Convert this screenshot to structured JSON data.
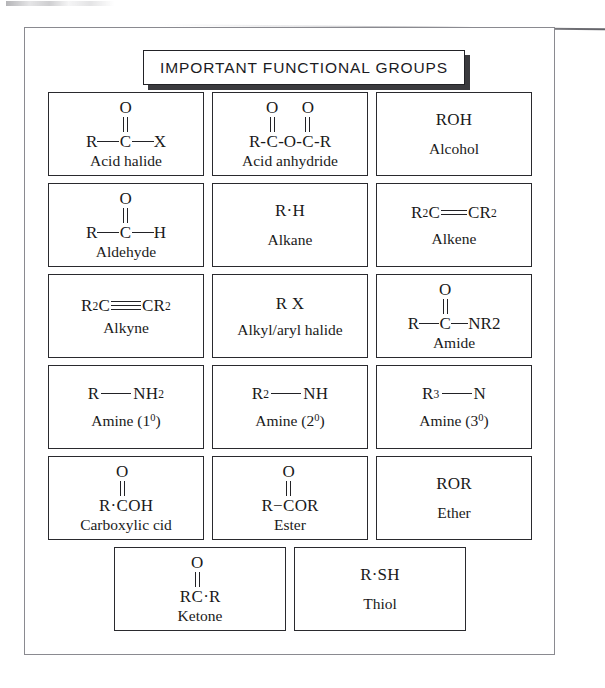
{
  "document": {
    "title": "IMPORTANT FUNCTIONAL GROUPS"
  },
  "groups": [
    {
      "name": "acid-halide",
      "label": "Acid halide",
      "formula": "R—C(=O)—X",
      "left": "R",
      "center": "C",
      "right": "X",
      "top": "O",
      "bond_style": "carbonyl-long"
    },
    {
      "name": "acid-anhydride",
      "label": "Acid anhydride",
      "formula": "R-C(=O)-O-C(=O)-R",
      "left": "R-",
      "center": "C",
      "mid": "-O-",
      "center2": "C",
      "right": "-R",
      "top": "O",
      "top2": "O",
      "bond_style": "anhydride"
    },
    {
      "name": "alcohol",
      "label": "Alcohol",
      "formula": "ROH",
      "bond_style": "plain"
    },
    {
      "name": "aldehyde",
      "label": "Aldehyde",
      "formula": "R—C(=O)—H",
      "left": "R",
      "center": "C",
      "right": "H",
      "top": "O",
      "bond_style": "carbonyl-long"
    },
    {
      "name": "alkane",
      "label": "Alkane",
      "formula": "R·H",
      "bond_style": "plain"
    },
    {
      "name": "alkene",
      "label": "Alkene",
      "formula": "R2C=CR2",
      "left_main": "R",
      "left_sub": "2",
      "left_tail": "C",
      "right_head": "C",
      "right_main": "R",
      "right_sub": "2",
      "bond_style": "double-horizontal"
    },
    {
      "name": "alkyne",
      "label": "Alkyne",
      "formula": "R2C≡CR2",
      "left_main": "R",
      "left_sub": "2",
      "left_tail": "C",
      "right_head": "C",
      "right_main": "R",
      "right_sub": "2",
      "bond_style": "triple-horizontal"
    },
    {
      "name": "alkyl-aryl-halide",
      "label": "Alkyl/aryl halide",
      "formula": "R X",
      "bond_style": "plain"
    },
    {
      "name": "amide",
      "label": "Amide",
      "formula": "R—C(=O)—NR2",
      "left": "R",
      "center": "C",
      "right_main": "NR",
      "right_sub": "2",
      "top": "O",
      "bond_style": "carbonyl-long"
    },
    {
      "name": "amine-primary",
      "label": "Amine (1",
      "label_sup": "0",
      "label_tail": ")",
      "formula": "R—NH2",
      "left": "R",
      "right_main": "NH",
      "right_sub": "2",
      "bond_style": "single-long"
    },
    {
      "name": "amine-secondary",
      "label": "Amine (2",
      "label_sup": "0",
      "label_tail": ")",
      "formula": "R2—NH",
      "left_main": "R",
      "left_sub": "2",
      "right_main": "NH",
      "bond_style": "single-long"
    },
    {
      "name": "amine-tertiary",
      "label": "Amine (3",
      "label_sup": "0",
      "label_tail": ")",
      "formula": "R3—N",
      "left_main": "R",
      "left_sub": "3",
      "right_main": "N",
      "bond_style": "single-long"
    },
    {
      "name": "carboxylic-acid",
      "label": "Carboxylic cid",
      "formula": "R·C(=O)OH",
      "left": "R·",
      "center": "C",
      "right": "OH",
      "top": "O",
      "bond_style": "carbonyl-tight"
    },
    {
      "name": "ester",
      "label": "Ester",
      "formula": "R−C(=O)OR",
      "left": "R−",
      "center": "C",
      "right": "OR",
      "top": "O",
      "bond_style": "carbonyl-tight"
    },
    {
      "name": "ether",
      "label": "Ether",
      "formula": "ROR",
      "bond_style": "plain"
    },
    {
      "name": "ketone",
      "label": "Ketone",
      "formula": "RC·R",
      "left": "R",
      "center": "C",
      "right": "·R",
      "top": "O",
      "bond_style": "carbonyl-tight"
    },
    {
      "name": "thiol",
      "label": "Thiol",
      "formula": "R·SH",
      "bond_style": "plain"
    }
  ]
}
